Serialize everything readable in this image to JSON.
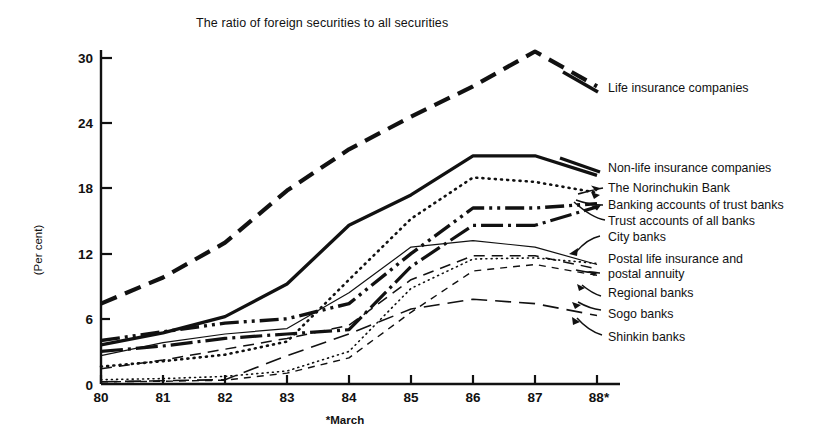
{
  "chart_data": {
    "type": "line",
    "title": "The ratio of foreign securities to all securities",
    "xlabel": "",
    "ylabel": "(Per cent)",
    "footnote": "*March",
    "x": [
      "80",
      "81",
      "82",
      "83",
      "84",
      "85",
      "86",
      "87",
      "88*"
    ],
    "xtick_labels": [
      "80",
      "81",
      "82",
      "83",
      "84",
      "85",
      "86",
      "87",
      "88*"
    ],
    "ytick_labels": [
      "0",
      "6",
      "12",
      "18",
      "24",
      "30"
    ],
    "ytick_values": [
      0,
      6,
      12,
      18,
      24,
      30
    ],
    "ylim": [
      0,
      32.5
    ],
    "grid": false,
    "legend_position": "right-inline-labels",
    "series": [
      {
        "name": "Life insurance companies",
        "style": "long-dash",
        "width": 4.2,
        "values": [
          7.4,
          9.8,
          13.0,
          17.8,
          21.6,
          24.6,
          27.4,
          30.6,
          27.4
        ]
      },
      {
        "name": "Non-life insurance companies",
        "style": "solid",
        "width": 3.3,
        "values": [
          3.6,
          4.7,
          6.2,
          9.2,
          14.6,
          17.4,
          21.0,
          21.0,
          19.2
        ]
      },
      {
        "name": "The Norinchukin Bank",
        "style": "dotted",
        "width": 2.6,
        "values": [
          1.6,
          2.1,
          2.7,
          3.9,
          9.6,
          15.2,
          19.0,
          18.6,
          17.6
        ]
      },
      {
        "name": "Banking accounts of trust banks",
        "style": "dash-dot-dot",
        "width": 3.4,
        "values": [
          4.0,
          4.8,
          5.6,
          6.0,
          7.4,
          12.0,
          16.2,
          16.2,
          16.6
        ]
      },
      {
        "name": "Trust accounts of all banks",
        "style": "dash-dot",
        "width": 3.2,
        "values": [
          3.0,
          3.5,
          4.2,
          4.6,
          5.0,
          10.8,
          14.6,
          14.6,
          16.3
        ]
      },
      {
        "name": "City banks",
        "style": "thin-solid",
        "width": 1.2,
        "values": [
          2.6,
          3.8,
          4.6,
          5.1,
          8.4,
          12.6,
          13.2,
          12.6,
          11.0
        ]
      },
      {
        "name": "Postal life insurance and postal annuity",
        "style": "fine-dotted",
        "width": 1.6,
        "values": [
          0.4,
          0.5,
          0.7,
          1.2,
          3.0,
          8.8,
          11.5,
          11.6,
          11.1
        ]
      },
      {
        "name": "Regional banks",
        "style": "medium-dash",
        "width": 1.5,
        "values": [
          1.4,
          2.2,
          3.2,
          4.2,
          5.4,
          9.6,
          11.8,
          11.8,
          10.6
        ]
      },
      {
        "name": "Sogo banks",
        "style": "long-thin-dash",
        "width": 1.6,
        "values": [
          0.2,
          0.3,
          0.4,
          2.6,
          4.6,
          6.9,
          7.8,
          7.4,
          6.3
        ]
      },
      {
        "name": "Shinkin banks",
        "style": "short-thin-dash",
        "width": 1.4,
        "values": [
          0.2,
          0.25,
          0.35,
          1.0,
          2.4,
          6.6,
          10.4,
          11.0,
          10.0
        ]
      }
    ]
  },
  "labels": {
    "life": "Life insurance companies",
    "nonlife": "Non-life insurance companies",
    "norinchukin": "The Norinchukin Bank",
    "banking_trust": "Banking accounts of trust banks",
    "trust_all": "Trust accounts of all banks",
    "city": "City banks",
    "postal1": "Postal life insurance and",
    "postal2": "postal annuity",
    "regional": "Regional banks",
    "sogo": "Sogo banks",
    "shinkin": "Shinkin banks"
  },
  "colors": {
    "ink": "#111111",
    "background": "#ffffff"
  }
}
